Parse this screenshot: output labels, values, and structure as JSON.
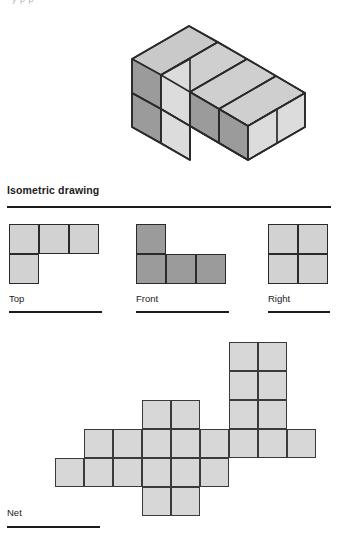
{
  "page": {
    "top_cutoff_text": "y        p                                                          p",
    "background": "#ffffff"
  },
  "colors": {
    "face_top": "#c9c9c9",
    "face_left": "#9b9b9b",
    "face_right": "#dcdcdc",
    "outline": "#2a2a2a",
    "view_light": "#d2d2d2",
    "view_dark": "#9b9b9b",
    "net_fill": "#d7d7d7",
    "rule": "#1b1b1b"
  },
  "section": {
    "title": "Isometric drawing"
  },
  "views": [
    {
      "id": "top",
      "label": "Top",
      "shade": "light",
      "cols": 3,
      "rows": 2,
      "cells": [
        {
          "c": 0,
          "r": 0
        },
        {
          "c": 1,
          "r": 0
        },
        {
          "c": 2,
          "r": 0
        },
        {
          "c": 0,
          "r": 1
        }
      ]
    },
    {
      "id": "front",
      "label": "Front",
      "shade": "dark",
      "cols": 3,
      "rows": 2,
      "cells": [
        {
          "c": 0,
          "r": 0
        },
        {
          "c": 0,
          "r": 1
        },
        {
          "c": 1,
          "r": 1
        },
        {
          "c": 2,
          "r": 1
        }
      ]
    },
    {
      "id": "right",
      "label": "Right",
      "shade": "light",
      "cols": 2,
      "rows": 2,
      "cells": [
        {
          "c": 0,
          "r": 0
        },
        {
          "c": 1,
          "r": 0
        },
        {
          "c": 0,
          "r": 1
        },
        {
          "c": 1,
          "r": 1
        }
      ]
    }
  ],
  "net": {
    "label": "Net",
    "cell_size": 29,
    "cols": 10,
    "rows": 6,
    "cells": [
      {
        "c": 7,
        "r": 0
      },
      {
        "c": 8,
        "r": 0
      },
      {
        "c": 7,
        "r": 1
      },
      {
        "c": 8,
        "r": 1
      },
      {
        "c": 4,
        "r": 2
      },
      {
        "c": 5,
        "r": 2
      },
      {
        "c": 7,
        "r": 2
      },
      {
        "c": 8,
        "r": 2
      },
      {
        "c": 2,
        "r": 3
      },
      {
        "c": 3,
        "r": 3
      },
      {
        "c": 4,
        "r": 3
      },
      {
        "c": 5,
        "r": 3
      },
      {
        "c": 6,
        "r": 3
      },
      {
        "c": 7,
        "r": 3
      },
      {
        "c": 8,
        "r": 3
      },
      {
        "c": 9,
        "r": 3
      },
      {
        "c": 1,
        "r": 4
      },
      {
        "c": 2,
        "r": 4
      },
      {
        "c": 3,
        "r": 4
      },
      {
        "c": 4,
        "r": 4
      },
      {
        "c": 5,
        "r": 4
      },
      {
        "c": 6,
        "r": 4
      },
      {
        "c": 4,
        "r": 5
      },
      {
        "c": 5,
        "r": 5
      }
    ]
  },
  "isometric": {
    "description": "L-shaped solid of 5 unit cubes drawn in isometric projection",
    "cube_count": 5
  }
}
